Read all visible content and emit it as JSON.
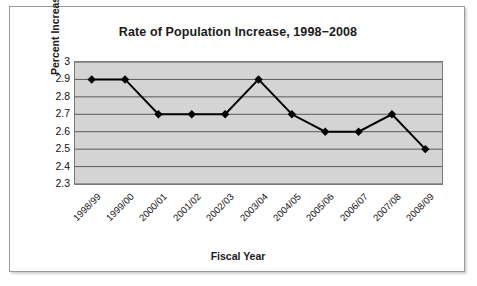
{
  "chart_data": {
    "type": "line",
    "title": "Rate of Population Increase, 1998−2008",
    "xlabel": "Fiscal Year",
    "ylabel": "Percent Increase",
    "categories": [
      "1998/99",
      "1999/00",
      "2000/01",
      "2001/02",
      "2002/03",
      "2003/04",
      "2004/05",
      "2005/06",
      "2006/07",
      "2007/08",
      "2008/09"
    ],
    "values": [
      2.9,
      2.9,
      2.7,
      2.7,
      2.7,
      2.9,
      2.7,
      2.6,
      2.6,
      2.7,
      2.5
    ],
    "ylim": [
      2.3,
      3.0
    ],
    "ytick_labels": [
      "3",
      "2.9",
      "2.8",
      "2.7",
      "2.6",
      "2.5",
      "2.4",
      "2.3"
    ],
    "ytick_values": [
      3.0,
      2.9,
      2.8,
      2.7,
      2.6,
      2.5,
      2.4,
      2.3
    ],
    "grid": true,
    "legend": false,
    "marker": "diamond",
    "colors": {
      "line": "#000000",
      "marker": "#000000",
      "plot_background": "#d4d4d4",
      "gridline": "#595959",
      "axis": "#555555",
      "frame_border": "#9a9a9a",
      "text": "#1a1a1a"
    }
  }
}
